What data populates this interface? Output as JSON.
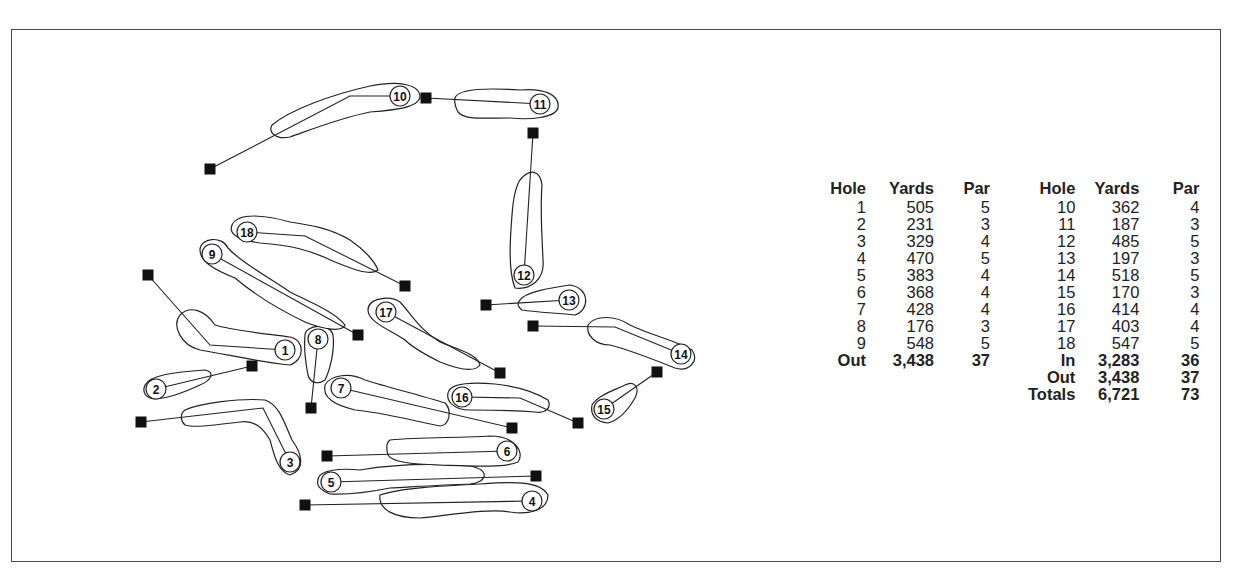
{
  "scorecard": {
    "headers": {
      "hole": "Hole",
      "yards": "Yards",
      "par": "Par"
    },
    "front_nine": [
      {
        "hole": "1",
        "yards": "505",
        "par": "5"
      },
      {
        "hole": "2",
        "yards": "231",
        "par": "3"
      },
      {
        "hole": "3",
        "yards": "329",
        "par": "4"
      },
      {
        "hole": "4",
        "yards": "470",
        "par": "5"
      },
      {
        "hole": "5",
        "yards": "383",
        "par": "4"
      },
      {
        "hole": "6",
        "yards": "368",
        "par": "4"
      },
      {
        "hole": "7",
        "yards": "428",
        "par": "4"
      },
      {
        "hole": "8",
        "yards": "176",
        "par": "3"
      },
      {
        "hole": "9",
        "yards": "548",
        "par": "5"
      }
    ],
    "front_total": {
      "label": "Out",
      "yards": "3,438",
      "par": "37"
    },
    "back_nine": [
      {
        "hole": "10",
        "yards": "362",
        "par": "4"
      },
      {
        "hole": "11",
        "yards": "187",
        "par": "3"
      },
      {
        "hole": "12",
        "yards": "485",
        "par": "5"
      },
      {
        "hole": "13",
        "yards": "197",
        "par": "3"
      },
      {
        "hole": "14",
        "yards": "518",
        "par": "5"
      },
      {
        "hole": "15",
        "yards": "170",
        "par": "3"
      },
      {
        "hole": "16",
        "yards": "414",
        "par": "4"
      },
      {
        "hole": "17",
        "yards": "403",
        "par": "4"
      },
      {
        "hole": "18",
        "yards": "547",
        "par": "5"
      }
    ],
    "back_totals": [
      {
        "label": "In",
        "yards": "3,283",
        "par": "36"
      },
      {
        "label": "Out",
        "yards": "3,438",
        "par": "37"
      },
      {
        "label": "Totals",
        "yards": "6,721",
        "par": "73"
      }
    ]
  },
  "course_map": {
    "legend": {
      "tee_marker": "filled-square",
      "green_marker": "numbered-circle"
    },
    "holes": [
      {
        "num": "1",
        "tee": [
          148,
          275
        ],
        "dog": [
          [
            210,
            345
          ]
        ],
        "green": [
          285,
          350
        ],
        "fairway": "M180,315 C190,305 205,310 215,325 C230,330 260,333 290,337 C305,340 305,360 290,365 C260,362 230,355 200,350 C180,345 172,325 180,315 Z"
      },
      {
        "num": "2",
        "tee": [
          252,
          366
        ],
        "dog": [],
        "green": [
          156,
          389
        ],
        "fairway": "M145,385 C150,375 175,372 205,370 C215,372 212,380 200,385 C185,392 170,398 155,399 C145,398 142,392 145,385 Z"
      },
      {
        "num": "3",
        "tee": [
          141,
          422
        ],
        "dog": [
          [
            263,
            408
          ]
        ],
        "green": [
          290,
          462
        ],
        "fairway": "M185,410 C200,403 240,398 265,400 C280,405 285,425 292,440 C303,455 305,470 290,475 C278,472 274,455 270,440 C263,428 255,420 240,422 C215,425 195,428 185,425 C180,420 180,414 185,410 Z"
      },
      {
        "num": "4",
        "tee": [
          305,
          505
        ],
        "dog": [],
        "green": [
          532,
          501
        ],
        "fairway": "M380,495 C400,488 440,486 480,484 C510,482 540,480 548,495 C548,510 530,515 510,512 C490,508 450,515 420,518 C395,518 378,510 380,495 Z"
      },
      {
        "num": "5",
        "tee": [
          536,
          476
        ],
        "dog": [],
        "green": [
          331,
          482
        ],
        "fairway": "M318,480 C318,470 340,468 360,470 C390,465 430,463 470,466 C490,470 488,482 470,484 C440,485 410,487 390,488 C370,492 350,495 330,494 C320,490 316,486 318,480 Z"
      },
      {
        "num": "6",
        "tee": [
          327,
          456
        ],
        "dog": [],
        "green": [
          507,
          451
        ],
        "fairway": "M390,440 C420,437 460,438 490,436 C515,436 525,452 518,462 C505,468 470,466 440,465 C410,464 392,462 388,455 C386,448 386,443 390,440 Z"
      },
      {
        "num": "7",
        "tee": [
          512,
          428
        ],
        "dog": [],
        "green": [
          341,
          388
        ],
        "fairway": "M325,385 C330,375 350,372 365,380 C390,388 420,395 445,403 C452,410 450,425 440,426 C410,420 380,412 355,410 C335,405 322,398 325,385 Z"
      },
      {
        "num": "8",
        "tee": [
          311,
          408
        ],
        "dog": [],
        "green": [
          318,
          339
        ],
        "fairway": "M305,335 C305,325 330,322 333,335 C335,350 330,370 325,380 C318,385 310,383 308,375 C305,360 304,345 305,335 Z"
      },
      {
        "num": "9",
        "tee": [
          358,
          335
        ],
        "dog": [],
        "green": [
          212,
          254
        ],
        "fairway": "M200,250 C200,238 222,235 228,248 C240,262 270,278 290,292 C310,302 335,312 345,325 C342,332 325,330 305,322 C280,310 255,295 235,278 C215,270 200,262 200,250 Z"
      },
      {
        "num": "10",
        "tee": [
          210,
          169
        ],
        "dog": [
          [
            350,
            96
          ]
        ],
        "green": [
          400,
          96
        ],
        "fairway": "M272,125 C290,110 330,95 370,86 C400,80 420,85 420,97 C418,108 395,110 370,112 C340,118 310,130 290,137 C275,140 268,132 272,125 Z"
      },
      {
        "num": "11",
        "tee": [
          426,
          98
        ],
        "dog": [],
        "green": [
          540,
          104
        ],
        "fairway": "M455,98 C458,88 490,88 520,90 C545,88 560,95 558,108 C555,118 530,120 510,118 C480,118 465,120 458,112 C455,106 454,102 455,98 Z"
      },
      {
        "num": "12",
        "tee": [
          533,
          133
        ],
        "dog": [],
        "green": [
          524,
          275
        ],
        "fairway": "M520,180 C530,168 540,170 542,185 C540,210 542,235 543,260 C545,280 530,290 515,288 C508,270 510,240 512,215 C513,200 515,188 520,180 Z"
      },
      {
        "num": "13",
        "tee": [
          486,
          305
        ],
        "dog": [],
        "green": [
          569,
          300
        ],
        "fairway": "M520,300 C525,292 550,288 570,285 C590,288 590,310 575,315 C555,313 535,312 522,310 C517,306 517,303 520,300 Z"
      },
      {
        "num": "14",
        "tee": [
          533,
          326
        ],
        "dog": [
          [
            615,
            327
          ]
        ],
        "green": [
          681,
          354
        ],
        "fairway": "M588,325 C595,315 615,315 630,325 C650,335 675,340 692,350 C700,362 688,372 675,368 C650,358 630,350 610,345 C595,345 586,335 588,325 Z"
      },
      {
        "num": "15",
        "tee": [
          657,
          372
        ],
        "dog": [],
        "green": [
          604,
          409
        ],
        "fairway": "M592,405 C598,395 615,390 625,385 C635,380 640,388 635,398 C628,410 620,420 608,423 C596,422 590,415 592,405 Z"
      },
      {
        "num": "16",
        "tee": [
          578,
          423
        ],
        "dog": [
          [
            520,
            398
          ]
        ],
        "green": [
          462,
          397
        ],
        "fairway": "M448,393 C450,383 470,382 495,384 C515,386 535,392 548,400 C552,408 545,414 535,412 C510,410 490,410 470,410 C455,410 446,402 448,393 Z"
      },
      {
        "num": "17",
        "tee": [
          500,
          373
        ],
        "dog": [],
        "green": [
          386,
          312
        ],
        "fairway": "M368,310 C368,298 390,295 400,302 C412,315 420,330 440,342 C460,350 478,355 480,365 C475,372 460,370 440,362 C420,352 410,345 405,340 C390,330 368,322 368,310 Z"
      },
      {
        "num": "18",
        "tee": [
          405,
          286
        ],
        "dog": [
          [
            305,
            236
          ]
        ],
        "green": [
          247,
          232
        ],
        "fairway": "M232,225 C238,212 265,215 290,222 C310,225 330,228 350,240 C365,250 375,262 378,270 C370,276 355,270 335,262 C310,250 290,245 260,243 C240,240 228,235 232,225 Z"
      }
    ]
  }
}
